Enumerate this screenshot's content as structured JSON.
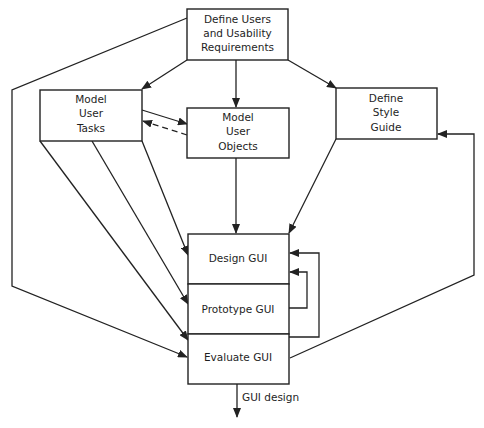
{
  "diagram": {
    "type": "flowchart",
    "colors": {
      "stroke": "#222222",
      "text": "#1e1e1e",
      "background": "#ffffff"
    },
    "nodes": {
      "requirements": {
        "lines": [
          "Define Users",
          "and Usability",
          "Requirements"
        ]
      },
      "tasks": {
        "lines": [
          "Model",
          "User",
          "Tasks"
        ]
      },
      "objects": {
        "lines": [
          "Model",
          "User",
          "Objects"
        ]
      },
      "style_guide": {
        "lines": [
          "Define",
          "Style",
          "Guide"
        ]
      },
      "design": {
        "lines": [
          "Design GUI"
        ]
      },
      "prototype": {
        "lines": [
          "Prototype GUI"
        ]
      },
      "evaluate": {
        "lines": [
          "Evaluate GUI"
        ]
      }
    },
    "edges": [
      {
        "from": "requirements",
        "to": "tasks",
        "style": "solid"
      },
      {
        "from": "requirements",
        "to": "objects",
        "style": "solid"
      },
      {
        "from": "requirements",
        "to": "style_guide",
        "style": "solid"
      },
      {
        "from": "requirements",
        "to": "evaluate",
        "style": "solid"
      },
      {
        "from": "tasks",
        "to": "objects",
        "style": "solid"
      },
      {
        "from": "objects",
        "to": "tasks",
        "style": "dashed"
      },
      {
        "from": "tasks",
        "to": "design",
        "style": "solid"
      },
      {
        "from": "tasks",
        "to": "prototype",
        "style": "solid"
      },
      {
        "from": "tasks",
        "to": "evaluate",
        "style": "solid"
      },
      {
        "from": "objects",
        "to": "design",
        "style": "solid"
      },
      {
        "from": "style_guide",
        "to": "design",
        "style": "solid"
      },
      {
        "from": "prototype",
        "to": "design",
        "style": "solid"
      },
      {
        "from": "evaluate",
        "to": "design",
        "style": "solid"
      },
      {
        "from": "evaluate",
        "to": "style_guide",
        "style": "solid"
      },
      {
        "from": "evaluate",
        "to": "output",
        "style": "solid",
        "label": "GUI design"
      }
    ],
    "output_label": "GUI design"
  }
}
